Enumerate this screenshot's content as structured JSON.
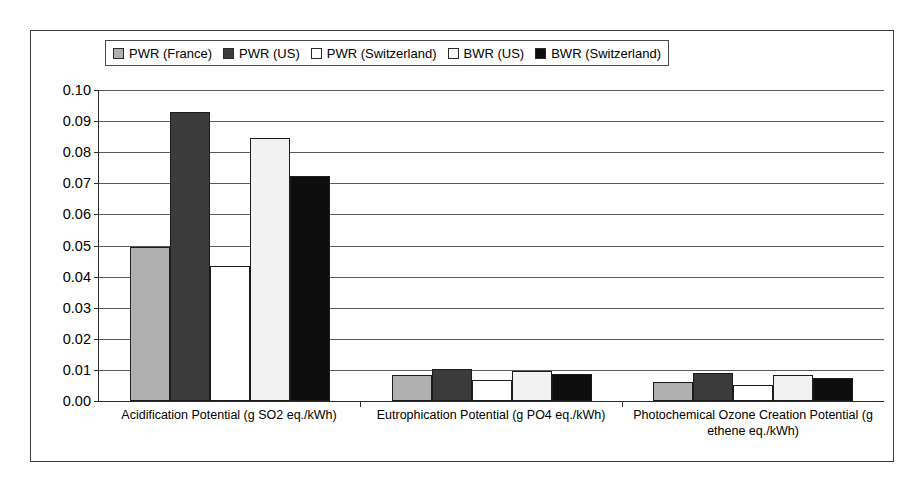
{
  "chart_data": {
    "type": "bar",
    "title": "",
    "xlabel": "",
    "ylabel": "",
    "ylim": [
      0,
      0.1
    ],
    "ytick_step": 0.01,
    "grid": true,
    "legend_position": "top",
    "categories": [
      "Acidification Potential (g SO2 eq./kWh)",
      "Eutrophication Potential (g PO4 eq./kWh)",
      "Photochemical Ozone Creation Potential (g ethene eq./kWh)"
    ],
    "ytick_labels": [
      "0.10",
      "0.09",
      "0.08",
      "0.07",
      "0.06",
      "0.05",
      "0.04",
      "0.03",
      "0.02",
      "0.01",
      "0.00"
    ],
    "ytick_values": [
      0.1,
      0.09,
      0.08,
      0.07,
      0.06,
      0.05,
      0.04,
      0.03,
      0.02,
      0.01,
      0.0
    ],
    "series": [
      {
        "name": "PWR (France)",
        "color": "#b0b0b0",
        "values": [
          0.0495,
          0.0085,
          0.0062
        ]
      },
      {
        "name": "PWR (US)",
        "color": "#3b3b3b",
        "values": [
          0.093,
          0.0103,
          0.009
        ]
      },
      {
        "name": "PWR (Switzerland)",
        "color": "#ffffff",
        "values": [
          0.0435,
          0.0068,
          0.0053
        ]
      },
      {
        "name": "BWR (US)",
        "color": "#f2f2f2",
        "values": [
          0.0845,
          0.0097,
          0.0083
        ]
      },
      {
        "name": "BWR (Switzerland)",
        "color": "#0d0d0d",
        "values": [
          0.0725,
          0.0088,
          0.0073
        ]
      }
    ]
  },
  "legend": {
    "items": [
      {
        "label": "PWR (France)",
        "color": "#b0b0b0"
      },
      {
        "label": "PWR (US)",
        "color": "#3b3b3b"
      },
      {
        "label": "PWR (Switzerland)",
        "color": "#ffffff"
      },
      {
        "label": "BWR (US)",
        "color": "#fbfbfb"
      },
      {
        "label": "BWR (Switzerland)",
        "color": "#0d0d0d"
      }
    ]
  },
  "colors": {
    "frame": "#3a3a3a",
    "axis": "#2b2b2b",
    "gridline": "#5a5a5a",
    "background": "#ffffff",
    "text": "#000000"
  }
}
